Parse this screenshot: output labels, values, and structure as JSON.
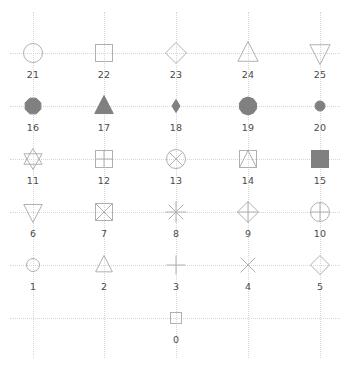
{
  "figure": {
    "title": "",
    "background_color": "#ffffff",
    "width": 349,
    "height": 370
  },
  "style": {
    "grid_color": "#d6d6d6",
    "grid_style": "dotted",
    "label_color": "#4a4a4a",
    "marker_edge_color": "#b0b0b0",
    "marker_fill_color": "#808080",
    "marker_unfilled_color": "#ffffff"
  },
  "axes": {
    "columns_x": [
      33,
      104,
      176,
      248,
      320
    ],
    "rows_y": [
      53,
      106,
      159,
      212,
      265,
      318
    ],
    "grid_visible": true,
    "ticks_visible": false,
    "spines_visible": false
  },
  "chart_data": {
    "type": "scatter",
    "title": "",
    "xlabel": "",
    "ylabel": "",
    "grid": true,
    "legend": null,
    "x": [
      176,
      33,
      104,
      176,
      248,
      320,
      33,
      104,
      176,
      248,
      320,
      33,
      104,
      176,
      248,
      320,
      33,
      104,
      176,
      248,
      320,
      33,
      104,
      176,
      248,
      320
    ],
    "y": [
      318,
      265,
      265,
      265,
      265,
      265,
      212,
      212,
      212,
      212,
      212,
      159,
      159,
      159,
      159,
      159,
      106,
      106,
      106,
      106,
      106,
      53,
      53,
      53,
      53,
      53
    ],
    "markers": [
      {
        "code": "0",
        "label": "0",
        "shape": "square-open-small",
        "col": 2,
        "row": 5,
        "size": 11,
        "filled": false
      },
      {
        "code": "1",
        "label": "1",
        "shape": "circle-open-small",
        "col": 0,
        "row": 4,
        "size": 13,
        "filled": false
      },
      {
        "code": "2",
        "label": "2",
        "shape": "triangle-up-open",
        "col": 1,
        "row": 4,
        "size": 19,
        "filled": false
      },
      {
        "code": "3",
        "label": "3",
        "shape": "plus",
        "col": 2,
        "row": 4,
        "size": 19,
        "filled": false
      },
      {
        "code": "4",
        "label": "4",
        "shape": "x-cross",
        "col": 3,
        "row": 4,
        "size": 19,
        "filled": false
      },
      {
        "code": "5",
        "label": "5",
        "shape": "diamond-open",
        "col": 4,
        "row": 4,
        "size": 19,
        "filled": false
      },
      {
        "code": "6",
        "label": "6",
        "shape": "triangle-down-open",
        "col": 0,
        "row": 3,
        "size": 21,
        "filled": false
      },
      {
        "code": "7",
        "label": "7",
        "shape": "square-x",
        "col": 1,
        "row": 3,
        "size": 17,
        "filled": false
      },
      {
        "code": "8",
        "label": "8",
        "shape": "asterisk-8",
        "col": 2,
        "row": 3,
        "size": 21,
        "filled": false
      },
      {
        "code": "9",
        "label": "9",
        "shape": "diamond-plus",
        "col": 3,
        "row": 3,
        "size": 21,
        "filled": false
      },
      {
        "code": "10",
        "label": "10",
        "shape": "circle-plus",
        "col": 4,
        "row": 3,
        "size": 19,
        "filled": false
      },
      {
        "code": "11",
        "label": "11",
        "shape": "hexagram-open",
        "col": 0,
        "row": 2,
        "size": 21,
        "filled": false
      },
      {
        "code": "12",
        "label": "12",
        "shape": "square-plus",
        "col": 1,
        "row": 2,
        "size": 17,
        "filled": false
      },
      {
        "code": "13",
        "label": "13",
        "shape": "circle-x",
        "col": 2,
        "row": 2,
        "size": 19,
        "filled": false
      },
      {
        "code": "14",
        "label": "14",
        "shape": "square-triangle",
        "col": 3,
        "row": 2,
        "size": 17,
        "filled": false
      },
      {
        "code": "15",
        "label": "15",
        "shape": "square-filled",
        "col": 4,
        "row": 2,
        "size": 17,
        "filled": true
      },
      {
        "code": "16",
        "label": "16",
        "shape": "octagon-filled",
        "col": 0,
        "row": 1,
        "size": 17,
        "filled": true
      },
      {
        "code": "17",
        "label": "17",
        "shape": "triangle-up-filled",
        "col": 1,
        "row": 1,
        "size": 21,
        "filled": true
      },
      {
        "code": "18",
        "label": "18",
        "shape": "diamond-thin-filled",
        "col": 2,
        "row": 1,
        "size": 13,
        "filled": true
      },
      {
        "code": "19",
        "label": "19",
        "shape": "pentagon-filled",
        "col": 3,
        "row": 1,
        "size": 18,
        "filled": true
      },
      {
        "code": "20",
        "label": "20",
        "shape": "circle-filled-small",
        "col": 4,
        "row": 1,
        "size": 10,
        "filled": true
      },
      {
        "code": "21",
        "label": "21",
        "shape": "circle-open",
        "col": 0,
        "row": 0,
        "size": 19,
        "filled": false
      },
      {
        "code": "22",
        "label": "22",
        "shape": "square-open",
        "col": 1,
        "row": 0,
        "size": 17,
        "filled": false
      },
      {
        "code": "23",
        "label": "23",
        "shape": "diamond-open-large",
        "col": 2,
        "row": 0,
        "size": 21,
        "filled": false
      },
      {
        "code": "24",
        "label": "24",
        "shape": "triangle-up-open-large",
        "col": 3,
        "row": 0,
        "size": 23,
        "filled": false
      },
      {
        "code": "25",
        "label": "25",
        "shape": "triangle-down-open-large",
        "col": 4,
        "row": 0,
        "size": 23,
        "filled": false
      }
    ]
  }
}
